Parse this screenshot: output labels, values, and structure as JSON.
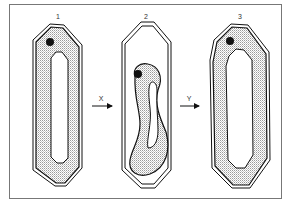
{
  "diagram": {
    "stages": [
      {
        "id": "1",
        "label": "1",
        "x": 58
      },
      {
        "id": "2",
        "label": "2",
        "x": 146
      },
      {
        "id": "3",
        "label": "3",
        "x": 240
      }
    ],
    "transitions": [
      {
        "label": "X",
        "from": "1",
        "to": "2"
      },
      {
        "label": "Y",
        "from": "2",
        "to": "3"
      }
    ],
    "colors": {
      "stroke": "#111111",
      "stipple": "#bdbdbd",
      "background": "#ffffff",
      "frame": "#777777"
    }
  }
}
